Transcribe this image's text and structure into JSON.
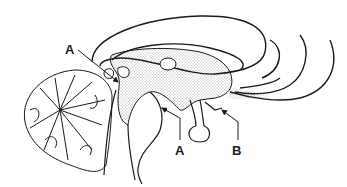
{
  "figure": {
    "colors": {
      "line": "#1a1a1a",
      "stipple": "#555555",
      "background": "#ffffff"
    }
  },
  "labels": [
    {
      "id": "label-a-top",
      "text": "A",
      "x": 65,
      "y": 43
    },
    {
      "id": "label-a-bottom",
      "text": "A",
      "x": 176,
      "y": 145
    },
    {
      "id": "label-b",
      "text": "B",
      "x": 232,
      "y": 145
    }
  ]
}
